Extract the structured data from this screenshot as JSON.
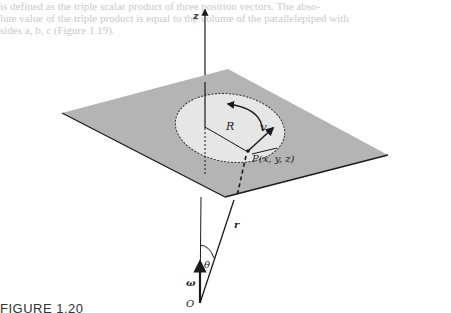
{
  "background_text": [
    "is defined as the triple scalar product of three position vectors. The abso-",
    "lute value of the triple product is equal to the volume of the parallelepiped with",
    "sides a, b, c (Figure 1.19)."
  ],
  "figure": {
    "labels": {
      "z_axis": "z",
      "radius": "R",
      "velocity": "v",
      "point": "P(x, y, z)",
      "position_vector": "r",
      "angle": "θ",
      "angular_velocity": "ω",
      "origin": "O"
    },
    "colors": {
      "plane_fill": "#b4b4b4",
      "circle_fill": "#e6e6e6",
      "line": "#1a1a1a"
    }
  },
  "caption": {
    "text": "FIGURE 1.20"
  }
}
